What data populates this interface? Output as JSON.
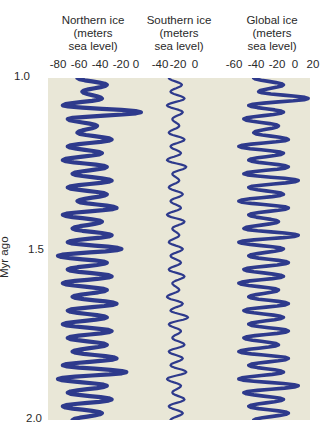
{
  "chart_data": {
    "type": "line",
    "title": "",
    "ylabel": "Myr ago",
    "ylim": [
      1.0,
      2.0
    ],
    "y_ticks": [
      "1.0",
      "1.5",
      "2.0"
    ],
    "grid": false,
    "orientation": "vertical-time",
    "line_color": "#2e3a8c",
    "background_color": "#e9e7d7",
    "panels": [
      {
        "name": "Northern ice",
        "title_lines": [
          "Northern ice",
          "(meters",
          "sea level)"
        ],
        "xlim": [
          -85,
          5
        ],
        "x_ticks": [
          "-80",
          "-60",
          "-40",
          "-20",
          "0"
        ],
        "amplitude_range": [
          -80,
          5
        ],
        "mean": -40
      },
      {
        "name": "Southern ice",
        "title_lines": [
          "Southern ice",
          "(meters",
          "sea level)"
        ],
        "xlim": [
          -50,
          5
        ],
        "x_ticks": [
          "-40",
          "-20",
          "0"
        ],
        "amplitude_range": [
          -35,
          -5
        ],
        "mean": -20
      },
      {
        "name": "Global ice",
        "title_lines": [
          "Global ice",
          "(meters",
          "sea level)"
        ],
        "xlim": [
          -65,
          25
        ],
        "x_ticks": [
          "-60",
          "-40",
          "-20",
          "0",
          "20"
        ],
        "amplitude_range": [
          -60,
          20
        ],
        "mean": -25
      }
    ],
    "series": [
      {
        "name": "Northern ice",
        "y_myr": [
          1.0,
          1.02,
          1.04,
          1.06,
          1.08,
          1.1,
          1.12,
          1.14,
          1.16,
          1.18,
          1.2,
          1.22,
          1.24,
          1.26,
          1.28,
          1.3,
          1.32,
          1.34,
          1.36,
          1.38,
          1.4,
          1.42,
          1.44,
          1.46,
          1.48,
          1.5,
          1.52,
          1.54,
          1.56,
          1.58,
          1.6,
          1.62,
          1.64,
          1.66,
          1.68,
          1.7,
          1.72,
          1.74,
          1.76,
          1.78,
          1.8,
          1.82,
          1.84,
          1.86,
          1.88,
          1.9,
          1.92,
          1.94,
          1.96,
          1.98,
          2.0
        ],
        "values": [
          -60,
          -30,
          -55,
          -35,
          -75,
          5,
          -70,
          -40,
          -60,
          -25,
          -70,
          -35,
          -75,
          -30,
          -65,
          -25,
          -70,
          -30,
          -60,
          -20,
          -75,
          -35,
          -65,
          -25,
          -70,
          -15,
          -80,
          -30,
          -70,
          -25,
          -75,
          -30,
          -65,
          -20,
          -70,
          -30,
          -75,
          -25,
          -70,
          -30,
          -65,
          -20,
          -75,
          -10,
          -80,
          -30,
          -70,
          -25,
          -75,
          -35,
          -65
        ]
      },
      {
        "name": "Southern ice",
        "y_myr": [
          1.0,
          1.02,
          1.04,
          1.06,
          1.08,
          1.1,
          1.12,
          1.14,
          1.16,
          1.18,
          1.2,
          1.22,
          1.24,
          1.26,
          1.28,
          1.3,
          1.32,
          1.34,
          1.36,
          1.38,
          1.4,
          1.42,
          1.44,
          1.46,
          1.48,
          1.5,
          1.52,
          1.54,
          1.56,
          1.58,
          1.6,
          1.62,
          1.64,
          1.66,
          1.68,
          1.7,
          1.72,
          1.74,
          1.76,
          1.78,
          1.8,
          1.82,
          1.84,
          1.86,
          1.88,
          1.9,
          1.92,
          1.94,
          1.96,
          1.98,
          2.0
        ],
        "values": [
          -30,
          -15,
          -28,
          -12,
          -32,
          -14,
          -26,
          -18,
          -30,
          -12,
          -28,
          -16,
          -32,
          -10,
          -26,
          -18,
          -30,
          -14,
          -28,
          -16,
          -32,
          -12,
          -26,
          -18,
          -30,
          -14,
          -28,
          -16,
          -30,
          -12,
          -26,
          -18,
          -32,
          -14,
          -28,
          -8,
          -30,
          -16,
          -26,
          -12,
          -30,
          -14,
          -28,
          -10,
          -32,
          -16,
          -26,
          -12,
          -30,
          -14,
          -28
        ]
      },
      {
        "name": "Global ice",
        "y_myr": [
          1.0,
          1.02,
          1.04,
          1.06,
          1.08,
          1.1,
          1.12,
          1.14,
          1.16,
          1.18,
          1.2,
          1.22,
          1.24,
          1.26,
          1.28,
          1.3,
          1.32,
          1.34,
          1.36,
          1.38,
          1.4,
          1.42,
          1.44,
          1.46,
          1.48,
          1.5,
          1.52,
          1.54,
          1.56,
          1.58,
          1.6,
          1.62,
          1.64,
          1.66,
          1.68,
          1.7,
          1.72,
          1.74,
          1.76,
          1.78,
          1.8,
          1.82,
          1.84,
          1.86,
          1.88,
          1.9,
          1.92,
          1.94,
          1.96,
          1.98,
          2.0
        ],
        "values": [
          -40,
          -10,
          -35,
          15,
          -45,
          -10,
          -50,
          -15,
          -40,
          -5,
          -55,
          -10,
          -45,
          -5,
          -50,
          5,
          -45,
          -10,
          -55,
          -5,
          -45,
          -15,
          -50,
          5,
          -55,
          -10,
          -45,
          -5,
          -50,
          -10,
          -55,
          -15,
          -45,
          -5,
          -50,
          -10,
          -45,
          -5,
          -50,
          -15,
          -55,
          -5,
          -45,
          -10,
          -55,
          5,
          -50,
          -10,
          -45,
          -5,
          -40
        ]
      }
    ]
  }
}
